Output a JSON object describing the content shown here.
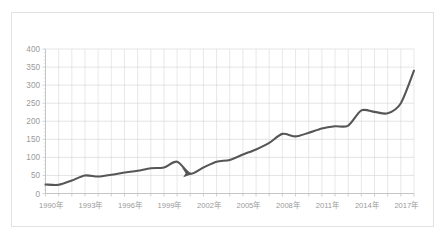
{
  "chart_data": {
    "type": "line",
    "title": "",
    "xlabel": "",
    "ylabel": "",
    "xlim": [
      1990,
      2018
    ],
    "ylim": [
      0,
      400
    ],
    "grid": true,
    "legend": false,
    "legend_position": "none",
    "line_color": "#565656",
    "x": [
      1990,
      1991,
      1992,
      1993,
      1994,
      1995,
      1996,
      1997,
      1998,
      1999,
      2000,
      2001,
      2002,
      2003,
      2004,
      2005,
      2006,
      2007,
      2008,
      2009,
      2010,
      2011,
      2012,
      2013,
      2014,
      2015,
      2016,
      2017,
      2018
    ],
    "values": [
      25,
      24,
      36,
      50,
      47,
      52,
      58,
      63,
      70,
      72,
      88,
      55,
      72,
      88,
      93,
      108,
      122,
      140,
      165,
      158,
      168,
      180,
      186,
      188,
      230,
      226,
      222,
      250,
      340
    ],
    "categories": [
      "1990",
      "1991",
      "1992",
      "1993",
      "1994",
      "1995",
      "1996",
      "1997",
      "1998",
      "1999",
      "2000",
      "2001",
      "2002",
      "2003",
      "2004",
      "2005",
      "2006",
      "2007",
      "2008",
      "2009",
      "2010",
      "2011",
      "2012",
      "2013",
      "2014",
      "2015",
      "2016",
      "2017",
      "2018"
    ],
    "y_ticks": [
      0,
      50,
      100,
      150,
      200,
      250,
      300,
      350,
      400
    ],
    "y_tick_labels": [
      "0",
      "50",
      "100",
      "150",
      "200",
      "250",
      "300",
      "350",
      "400"
    ],
    "x_ticks": [
      1990,
      1993,
      1996,
      1999,
      2002,
      2005,
      2008,
      2011,
      2014,
      2017
    ],
    "x_tick_labels": [
      "1990年",
      "1993年",
      "1996年",
      "1999年",
      "2002年",
      "2005年",
      "2008年",
      "2011年",
      "2014年",
      "2017年"
    ],
    "annotations": [
      {
        "name": "dip-arrow-marker",
        "shape": "arrowhead",
        "x": 2001,
        "y": 55,
        "direction": "right-down",
        "color": "#565656"
      }
    ]
  }
}
